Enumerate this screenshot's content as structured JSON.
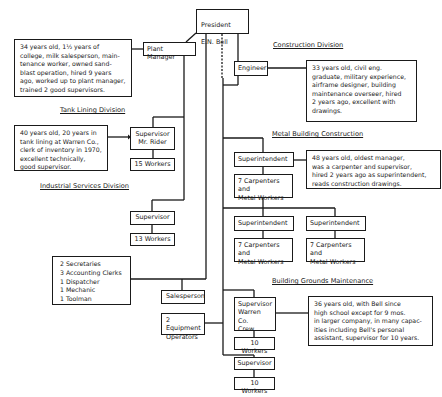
{
  "president": {
    "title": "President",
    "name": "E.N. Bell"
  },
  "plant_manager": {
    "label": "Plant Manager",
    "description": "34 years old, 1½ years of\ncollege, milk salesperson, main-\ntenance worker, owned sand-\nblast operation, hired 9 years\nago, worked up to plant manager,\ntrained 2 good supervisors."
  },
  "tank_lining": {
    "division_label": "Tank Lining Division",
    "supervisor": "Supervisor\nMr. Rider",
    "workers": "15 Workers",
    "description": "40 years old, 20 years in\ntank lining at Warren Co.,\nclerk of inventory in 1970,\nexcellent technically,\ngood supervisor."
  },
  "industrial_services": {
    "division_label": "Industrial Services Division",
    "supervisor": "Supervisor",
    "workers": "13 Workers"
  },
  "office_staff": "2 Secretaries\n3 Accounting Clerks\n1 Dispatcher\n1 Mechanic\n1 Toolman",
  "salesperson": "Salesperson",
  "equipment_operators": "2 Equipment\nOperators",
  "construction": {
    "division_label": "Construction Division",
    "engineer": "Engineer",
    "description": "33 years old, civil eng.\ngraduate, military experience,\nairframe designer, building\nmaintenance overseer, hired\n2 years ago, excellent with\ndrawings."
  },
  "metal_building": {
    "division_label": "Metal Building Construction",
    "superintendent_label": "Superintendent",
    "crew_label": "7 Carpenters and\nMetal Workers",
    "description": "48 years old, oldest manager,\nwas a carpenter and supervisor,\nhired 2 years ago as superintendent,\nreads construction drawings."
  },
  "building_grounds": {
    "division_label": "Building Grounds Maintenance",
    "supervisor_warren": "Supervisor\nWarren Co.\nCrew",
    "workers_1": "10 Workers",
    "supervisor": "Supervisor",
    "workers_2": "10 Workers",
    "description": "36 years old, with Bell since\nhigh school except for 9 mos.\nin larger company, in many capac-\nities including Bell's personal\nassistant, supervisor for 10 years."
  }
}
